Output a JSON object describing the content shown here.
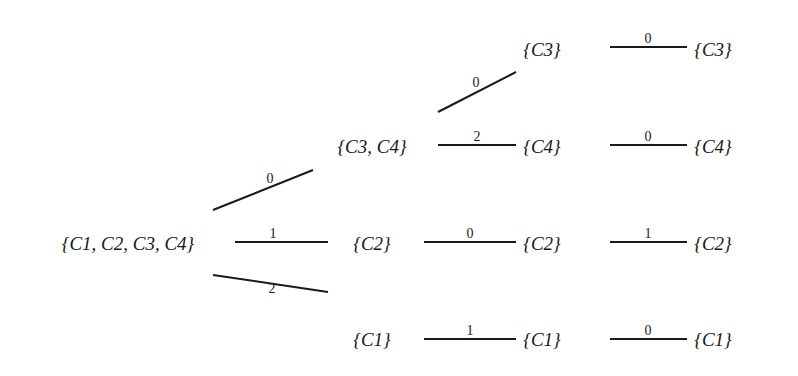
{
  "diagram": {
    "type": "tree",
    "nodes": [
      {
        "id": "root",
        "label": "{C1, C2, C3, C4}",
        "x": 128,
        "y": 250
      },
      {
        "id": "c34",
        "label": "{C3, C4}",
        "x": 372,
        "y": 153
      },
      {
        "id": "c2a",
        "label": "{C2}",
        "x": 372,
        "y": 250
      },
      {
        "id": "c1a",
        "label": "{C1}",
        "x": 372,
        "y": 346
      },
      {
        "id": "c3a",
        "label": "{C3}",
        "x": 542,
        "y": 56
      },
      {
        "id": "c4a",
        "label": "{C4}",
        "x": 542,
        "y": 153
      },
      {
        "id": "c2b",
        "label": "{C2}",
        "x": 542,
        "y": 250
      },
      {
        "id": "c1b",
        "label": "{C1}",
        "x": 542,
        "y": 346
      },
      {
        "id": "c3b",
        "label": "{C3}",
        "x": 713,
        "y": 56
      },
      {
        "id": "c4b",
        "label": "{C4}",
        "x": 713,
        "y": 153
      },
      {
        "id": "c2c",
        "label": "{C2}",
        "x": 713,
        "y": 250
      },
      {
        "id": "c1c",
        "label": "{C1}",
        "x": 713,
        "y": 346
      }
    ],
    "edges": [
      {
        "from": "root",
        "to": "c34",
        "label": "0",
        "x1": 213,
        "y1": 210,
        "x2": 313,
        "y2": 170,
        "lx": 270,
        "ly": 183
      },
      {
        "from": "root",
        "to": "c2a",
        "label": "1",
        "x1": 235,
        "y1": 242,
        "x2": 328,
        "y2": 242,
        "lx": 273,
        "ly": 238
      },
      {
        "from": "root",
        "to": "c1a",
        "label": "2",
        "x1": 213,
        "y1": 275,
        "x2": 328,
        "y2": 292,
        "lx": 272,
        "ly": 293
      },
      {
        "from": "c34",
        "to": "c3a",
        "label": "0",
        "x1": 438,
        "y1": 112,
        "x2": 516,
        "y2": 72,
        "lx": 476,
        "ly": 87
      },
      {
        "from": "c34",
        "to": "c4a",
        "label": "2",
        "x1": 438,
        "y1": 145,
        "x2": 516,
        "y2": 145,
        "lx": 477,
        "ly": 141
      },
      {
        "from": "c2a",
        "to": "c2b",
        "label": "0",
        "x1": 424,
        "y1": 242,
        "x2": 516,
        "y2": 242,
        "lx": 470,
        "ly": 238
      },
      {
        "from": "c1a",
        "to": "c1b",
        "label": "1",
        "x1": 424,
        "y1": 339,
        "x2": 516,
        "y2": 339,
        "lx": 470,
        "ly": 335
      },
      {
        "from": "c3a",
        "to": "c3b",
        "label": "0",
        "x1": 610,
        "y1": 47,
        "x2": 687,
        "y2": 47,
        "lx": 648,
        "ly": 43
      },
      {
        "from": "c4a",
        "to": "c4b",
        "label": "0",
        "x1": 610,
        "y1": 145,
        "x2": 687,
        "y2": 145,
        "lx": 648,
        "ly": 141
      },
      {
        "from": "c2b",
        "to": "c2c",
        "label": "1",
        "x1": 610,
        "y1": 242,
        "x2": 687,
        "y2": 242,
        "lx": 648,
        "ly": 238
      },
      {
        "from": "c1b",
        "to": "c1c",
        "label": "0",
        "x1": 610,
        "y1": 339,
        "x2": 687,
        "y2": 339,
        "lx": 648,
        "ly": 335
      }
    ]
  }
}
